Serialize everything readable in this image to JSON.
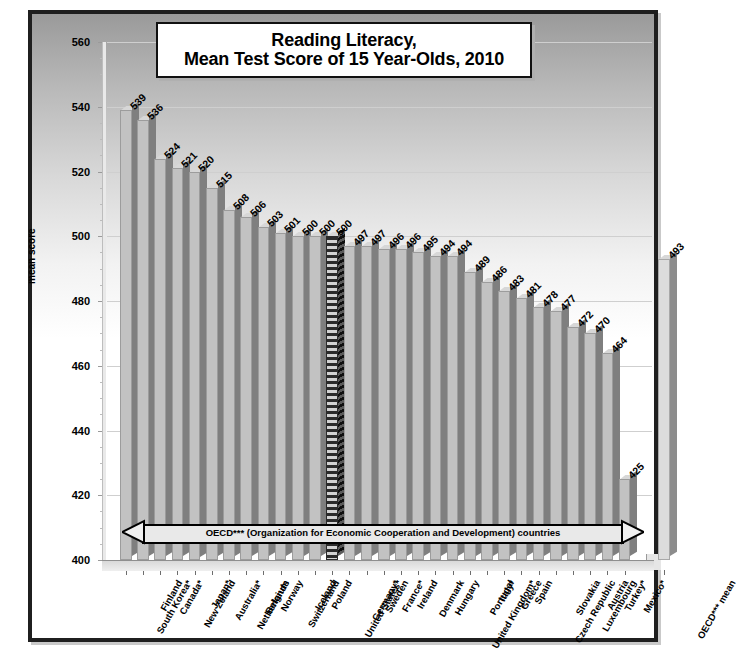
{
  "chart_data": {
    "type": "bar",
    "title": "Reading Literacy, Mean Test Score of 15 Year-Olds, 2010",
    "title_line1": "Reading Literacy,",
    "title_line2": "Mean Test Score of 15 Year-Olds, 2010",
    "xlabel": "",
    "ylabel": "mean score",
    "ylim": [
      400,
      560
    ],
    "ytick_step": 20,
    "yticks": [
      400,
      420,
      440,
      460,
      480,
      500,
      520,
      540,
      560
    ],
    "grid": true,
    "legend": "none",
    "annotation": "OECD*** (Organization for Economic Cooperation and Development) countries",
    "categories": [
      "South Korea*",
      "Finland",
      "Canada*",
      "New Zeland",
      "Japan*",
      "Australia*",
      "Netherlands",
      "Belgium",
      "Norway",
      "Switzerland",
      "Iceland",
      "Poland",
      "United States*",
      "Germany*",
      "Sweden",
      "France*",
      "Ireland",
      "Denmark",
      "Hungary",
      "United Kingdom*",
      "Portugal",
      "Italy*",
      "Greece",
      "Spain",
      "Czech Republic",
      "Slovakia",
      "Luxembourg",
      "Austria",
      "Turkey*",
      "Mexico*",
      "OECD*** mean"
    ],
    "values": [
      539,
      536,
      524,
      521,
      520,
      515,
      508,
      506,
      503,
      501,
      500,
      500,
      500,
      497,
      497,
      496,
      496,
      495,
      494,
      494,
      489,
      486,
      483,
      481,
      478,
      477,
      472,
      470,
      464,
      425,
      493
    ],
    "highlight_index": 12,
    "mean_index": 30
  },
  "colors": {
    "bar_face": "#c2c2c2",
    "bar_side": "#7f7f7f",
    "mean_face": "#dcdcdc",
    "highlight": "#2b2b2b",
    "frame": "#1f1f1f",
    "grid": "#cfcfcf"
  }
}
